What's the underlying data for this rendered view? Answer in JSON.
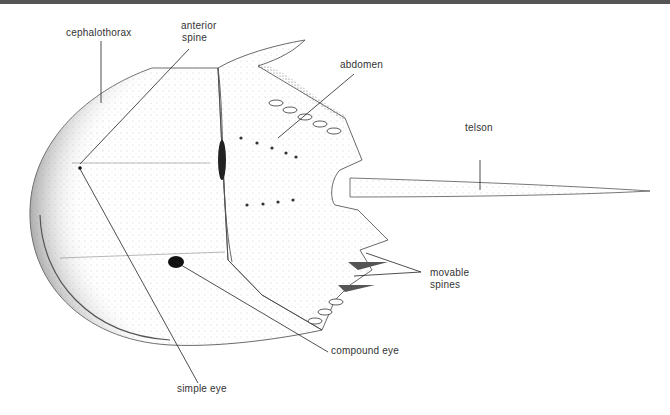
{
  "diagram": {
    "labels": {
      "cephalothorax": "cephalothorax",
      "anterior_spine_1": "anterior",
      "anterior_spine_2": "spine",
      "abdomen": "abdomen",
      "telson": "telson",
      "movable_spines_1": "movable",
      "movable_spines_2": "spines",
      "compound_eye": "compound eye",
      "simple_eye": "simple eye"
    },
    "colors": {
      "ink": "#222222",
      "stipple": "#9a9a9a",
      "background": "#ffffff",
      "top_rule": "#555555"
    }
  }
}
